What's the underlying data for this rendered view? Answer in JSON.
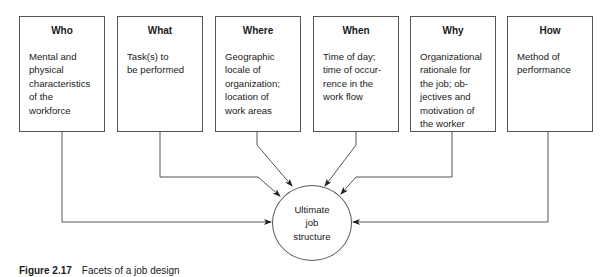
{
  "diagram": {
    "facets": [
      {
        "title": "Who",
        "description": "Mental and\nphysical\ncharacteristics\nof the\nworkforce"
      },
      {
        "title": "What",
        "description": "Task(s) to\nbe performed"
      },
      {
        "title": "Where",
        "description": "Geographic\nlocale of\norganization;\nlocation of\nwork areas"
      },
      {
        "title": "When",
        "description": "Time of day;\ntime of occur-\nrence in the\nwork flow"
      },
      {
        "title": "Why",
        "description": "Organizational\nrationale for\nthe job; ob-\njectives and\nmotivation of\nthe worker"
      },
      {
        "title": "How",
        "description": "Method of\nperformance"
      }
    ],
    "hub": {
      "label": "Ultimate\njob\nstructure"
    },
    "caption": {
      "number": "Figure 2.17",
      "text": "Facets of a job design"
    },
    "colors": {
      "line": "#555555",
      "text": "#1a1a1a",
      "background": "#ffffff"
    }
  }
}
